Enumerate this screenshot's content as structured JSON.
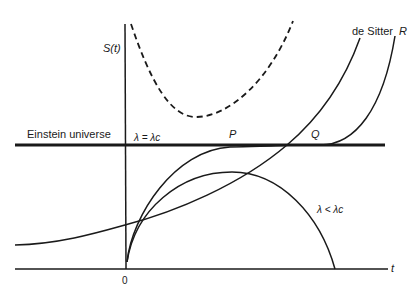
{
  "diagram": {
    "axes": {
      "y_label": "S(t)",
      "x_label": "t",
      "origin_label": "0"
    },
    "labels": {
      "einstein": "Einstein universe",
      "lambda_eq": "λ = λc",
      "point_p": "P",
      "point_q": "Q",
      "de_sitter": "de Sitter",
      "curve_r": "R",
      "lambda_lt": "λ < λc"
    },
    "colors": {
      "ink": "#1a1a1a",
      "background": "#ffffff"
    }
  }
}
